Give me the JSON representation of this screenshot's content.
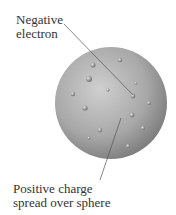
{
  "labels": {
    "electron_line1": "Negative",
    "electron_line2": "electron",
    "charge_line1": "Positive charge",
    "charge_line2": "spread over sphere"
  },
  "colors": {
    "sphere_light": "#c8c8c8",
    "sphere_dark": "#7a7a7a",
    "leader": "#555555"
  }
}
